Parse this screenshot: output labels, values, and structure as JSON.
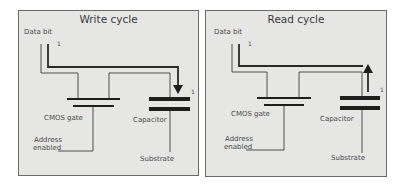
{
  "diagram": {
    "type": "DRAM cell write/read cycle",
    "panels": [
      {
        "id": "write",
        "title": "Write cycle",
        "labels": {
          "data_bit": "Data bit",
          "bit_value": "1",
          "cmos_gate": "CMOS gate",
          "address_line1": "Address",
          "address_line2": "enabled",
          "capacitor": "Capacitor",
          "capacitor_value": "1",
          "substrate": "Substrate"
        },
        "arrow_direction": "down"
      },
      {
        "id": "read",
        "title": "Read cycle",
        "labels": {
          "data_bit": "Data bit",
          "bit_value": "1",
          "cmos_gate": "CMOS gate",
          "address_line1": "Address",
          "address_line2": "enabled",
          "capacitor": "Capacitor",
          "capacitor_value": "1",
          "substrate": "Substrate"
        },
        "arrow_direction": "up"
      }
    ],
    "colors": {
      "panel_bg": "#e6e6e4",
      "border": "#6a6a6a",
      "wire": "#3c3c3c",
      "plate": "#1e1e1e"
    }
  }
}
